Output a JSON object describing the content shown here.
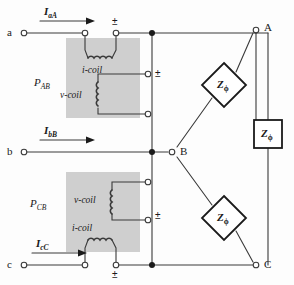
{
  "figure": {
    "type": "three-phase two-wattmeter circuit diagram",
    "background_color": "#fdfdfd",
    "line_color": "#3a3a3a",
    "wattmeter_box_fill": "#cfcfcf"
  },
  "source_terminals": [
    {
      "id": "a",
      "label": "a",
      "x": 16,
      "y": 33
    },
    {
      "id": "b",
      "label": "b",
      "x": 16,
      "y": 152
    },
    {
      "id": "c",
      "label": "c",
      "x": 16,
      "y": 265
    }
  ],
  "load_terminals": [
    {
      "id": "A",
      "label": "A",
      "x": 256,
      "y": 27
    },
    {
      "id": "B",
      "label": "B",
      "x": 172,
      "y": 152
    },
    {
      "id": "C",
      "label": "C",
      "x": 256,
      "y": 265
    }
  ],
  "currents": [
    {
      "label": "I",
      "sub": "aA",
      "x": 48,
      "y": 12
    },
    {
      "label": "I",
      "sub": "bB",
      "x": 48,
      "y": 130
    },
    {
      "label": "I",
      "sub": "cC",
      "x": 38,
      "y": 243
    }
  ],
  "wattmeters": [
    {
      "name": "P",
      "sub": "AB",
      "label_x": 38,
      "label_y": 83,
      "box": {
        "x": 66,
        "y": 38,
        "w": 74,
        "h": 80
      },
      "coils": [
        {
          "type": "i-coil",
          "label": "i-coil",
          "orientation": "horizontal"
        },
        {
          "type": "v-coil",
          "label": "v-coil",
          "orientation": "vertical"
        }
      ]
    },
    {
      "name": "P",
      "sub": "CB",
      "label_x": 34,
      "label_y": 204,
      "box": {
        "x": 66,
        "y": 172,
        "w": 74,
        "h": 80
      },
      "coils": [
        {
          "type": "v-coil",
          "label": "v-coil",
          "orientation": "vertical"
        },
        {
          "type": "i-coil",
          "label": "i-coil",
          "orientation": "horizontal"
        }
      ]
    }
  ],
  "polarity_marks": [
    {
      "symbol": "±",
      "x": 145,
      "y": 21,
      "desc": "i-coil top polarity PAB"
    },
    {
      "symbol": "±",
      "x": 175,
      "y": 74,
      "desc": "v-coil polarity PAB"
    },
    {
      "symbol": "±",
      "x": 175,
      "y": 216,
      "desc": "v-coil polarity PCB"
    },
    {
      "symbol": "±",
      "x": 145,
      "y": 269,
      "desc": "i-coil bottom polarity PCB"
    }
  ],
  "impedances": [
    {
      "label": "Z",
      "sub": "ϕ",
      "shape": "diamond",
      "cx": 224,
      "cy": 85,
      "size": 22,
      "desc": "phase impedance A-B branch"
    },
    {
      "label": "Z",
      "sub": "ϕ",
      "shape": "diamond",
      "cx": 224,
      "cy": 218,
      "size": 22,
      "desc": "phase impedance B-C branch"
    },
    {
      "label": "Z",
      "sub": "ϕ",
      "shape": "square",
      "cx": 268,
      "cy": 134,
      "size": 28,
      "desc": "phase impedance A-C branch"
    }
  ],
  "coil_labels": {
    "i_coil": "i-coil",
    "v_coil": "v-coil"
  }
}
